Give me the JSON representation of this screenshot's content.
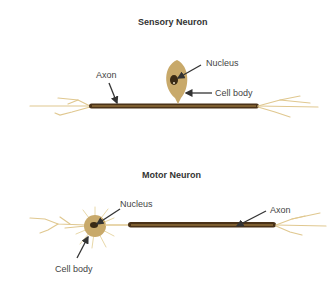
{
  "sensory": {
    "title": "Sensory Neuron",
    "labels": {
      "nucleus": "Nucleus",
      "axon": "Axon",
      "cell_body": "Cell body"
    }
  },
  "motor": {
    "title": "Motor Neuron",
    "labels": {
      "nucleus": "Nucleus",
      "axon": "Axon",
      "cell_body": "Cell body"
    }
  },
  "colors": {
    "cell_body": "#c8a96a",
    "axon_dark": "#4a3218",
    "axon_highlight": "#b08a48",
    "dendrite": "#e0c890",
    "nucleus": "#3a2a14",
    "arrow": "#333333"
  }
}
